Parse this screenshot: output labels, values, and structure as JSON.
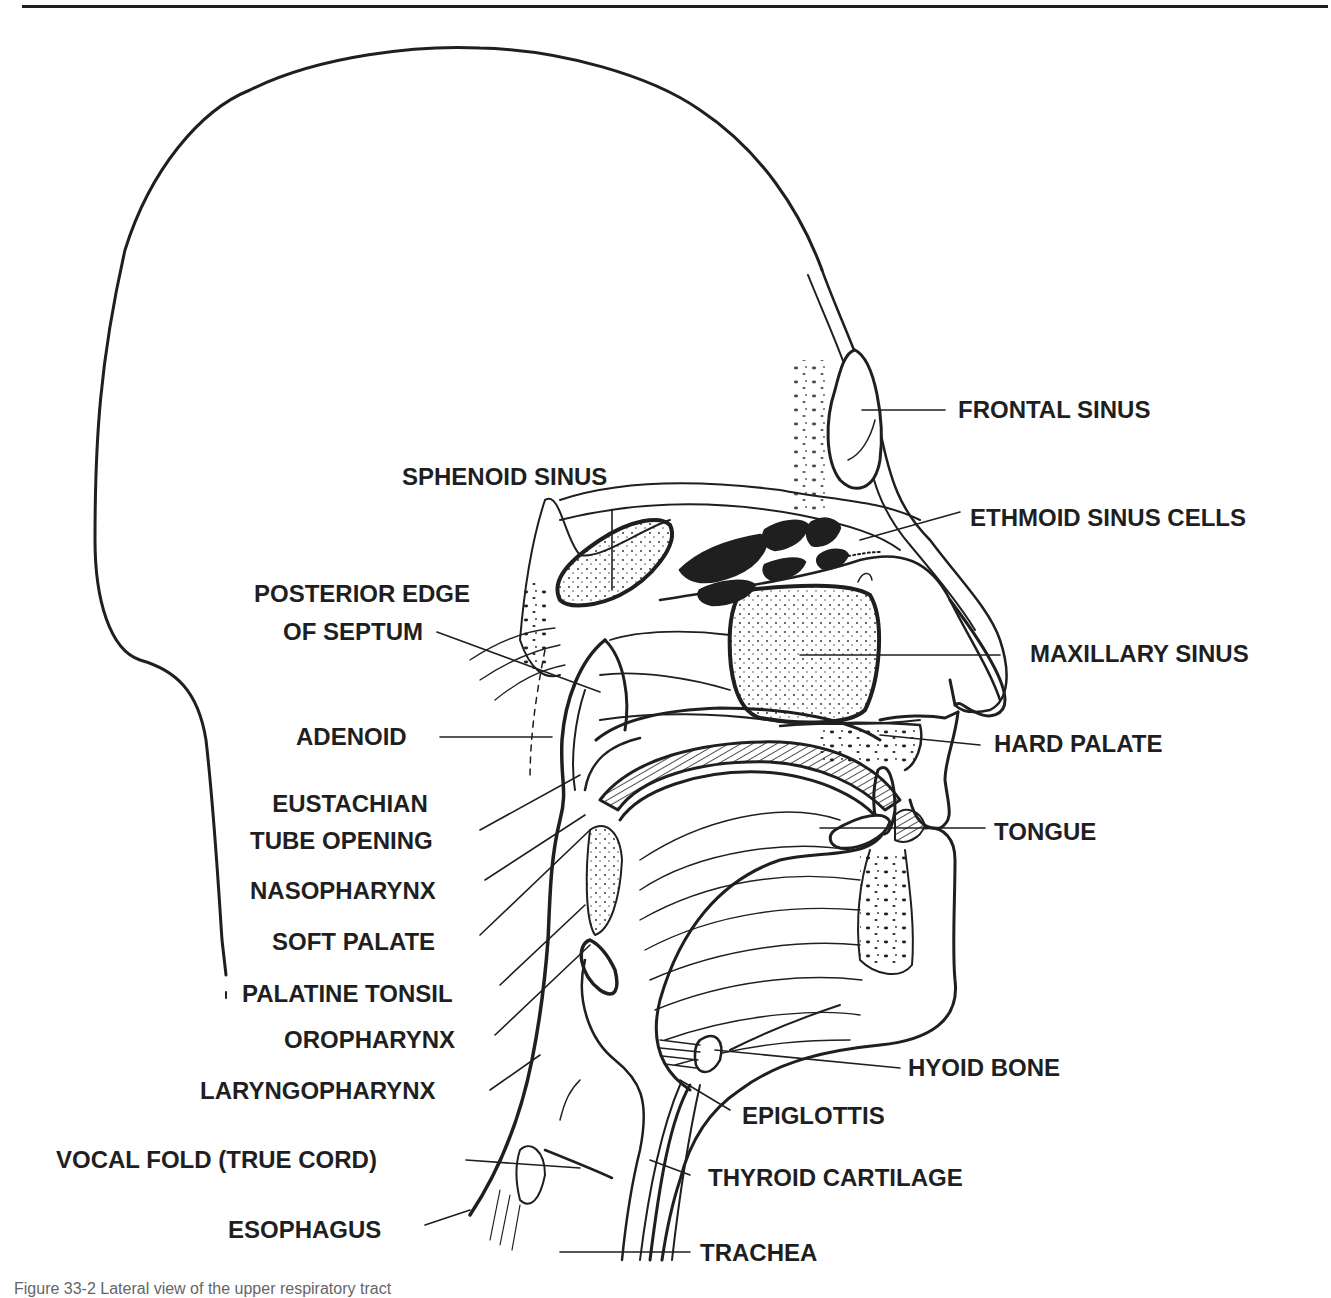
{
  "figure": {
    "caption_partial": "Figure 33-2 Lateral view of the upper respiratory tract"
  },
  "labels_right": [
    {
      "id": "frontal-sinus",
      "text": "FRONTAL SINUS"
    },
    {
      "id": "ethmoid-sinus-cells",
      "text": "ETHMOID SINUS CELLS"
    },
    {
      "id": "maxillary-sinus",
      "text": "MAXILLARY SINUS"
    },
    {
      "id": "hard-palate",
      "text": "HARD PALATE"
    },
    {
      "id": "tongue",
      "text": "TONGUE"
    },
    {
      "id": "hyoid-bone",
      "text": "HYOID BONE"
    },
    {
      "id": "epiglottis",
      "text": "EPIGLOTTIS"
    },
    {
      "id": "thyroid-cartilage",
      "text": "THYROID CARTILAGE"
    },
    {
      "id": "trachea",
      "text": "TRACHEA"
    }
  ],
  "labels_left": [
    {
      "id": "sphenoid-sinus",
      "text": "SPHENOID SINUS"
    },
    {
      "id": "posterior-edge-of-septum",
      "line1": "POSTERIOR EDGE",
      "line2": "OF SEPTUM"
    },
    {
      "id": "adenoid",
      "text": "ADENOID"
    },
    {
      "id": "eustachian-tube-opening",
      "line1": "EUSTACHIAN",
      "line2": "TUBE OPENING"
    },
    {
      "id": "nasopharynx",
      "text": "NASOPHARYNX"
    },
    {
      "id": "soft-palate",
      "text": "SOFT PALATE"
    },
    {
      "id": "palatine-tonsil",
      "text": "PALATINE TONSIL"
    },
    {
      "id": "oropharynx",
      "text": "OROPHARYNX"
    },
    {
      "id": "laryngopharynx",
      "text": "LARYNGOPHARYNX"
    },
    {
      "id": "vocal-fold",
      "text": "VOCAL FOLD (TRUE CORD)"
    },
    {
      "id": "esophagus",
      "text": "ESOPHAGUS"
    }
  ],
  "colors": {
    "ink": "#1f1f1f",
    "paper": "#ffffff"
  }
}
